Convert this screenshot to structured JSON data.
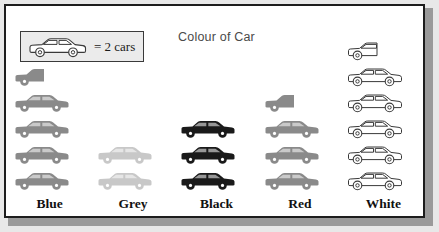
{
  "chart_data": {
    "type": "bar",
    "subtype": "pictograph",
    "title": "Colour of Car",
    "xlabel": "",
    "ylabel": "",
    "key_text": "= 2 cars",
    "symbol_value": 2,
    "symbol_name": "car-icon",
    "categories": [
      "Blue",
      "Grey",
      "Black",
      "Red",
      "White"
    ],
    "values": [
      9,
      4,
      6,
      7,
      11
    ],
    "symbols": [
      4.5,
      2,
      3,
      3.5,
      5.5
    ],
    "series": [
      {
        "name": "Number of cars",
        "values": [
          9,
          4,
          6,
          7,
          11
        ]
      }
    ],
    "grid": false,
    "legend_position": "top-left",
    "colors": {
      "blue_symbol": "#8a8a8a",
      "grey_symbol": "#c8c8c8",
      "black_symbol": "#1a1a1a",
      "red_symbol": "#8a8a8a",
      "white_symbol": "#ffffff",
      "outline": "#3a3a3a",
      "frame": "#1d1d1d",
      "title": "#4a4a4a"
    }
  },
  "frame": {
    "background": "#ffffff"
  },
  "legend": {
    "label": "= 2 cars"
  },
  "columns": [
    {
      "label": "Blue",
      "fill": "#8a8a8a",
      "stroke": "none",
      "full": 4,
      "half": 1
    },
    {
      "label": "Grey",
      "fill": "#c8c8c8",
      "stroke": "none",
      "full": 2,
      "half": 0
    },
    {
      "label": "Black",
      "fill": "#1a1a1a",
      "stroke": "none",
      "full": 3,
      "half": 0
    },
    {
      "label": "Red",
      "fill": "#8a8a8a",
      "stroke": "none",
      "full": 3,
      "half": 1
    },
    {
      "label": "White",
      "fill": "#ffffff",
      "stroke": "#3a3a3a",
      "full": 5,
      "half": 1
    }
  ]
}
